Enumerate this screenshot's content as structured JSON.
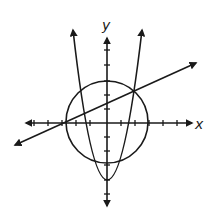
{
  "diagram": {
    "type": "coordinate-plane-graph",
    "axes": {
      "x_label": "x",
      "y_label": "y",
      "x_ticks": [
        -5,
        -4,
        -3,
        -2,
        -1,
        1,
        2,
        3,
        4,
        5
      ],
      "y_ticks": [
        -5,
        -4,
        -3,
        -2,
        -1,
        1,
        2,
        3,
        4,
        5
      ]
    },
    "curves": [
      {
        "name": "circle",
        "description": "Circle centered at origin, radius 3",
        "center": [
          0,
          0
        ],
        "radius": 3
      },
      {
        "name": "parabola",
        "description": "Upward-opening parabola with vertex at (0, -4)",
        "vertex": [
          0,
          -4
        ]
      },
      {
        "name": "line",
        "description": "Line with positive slope passing through (-3, 0)",
        "x_intercept": -3
      }
    ],
    "colors": {
      "stroke": "#1a1a1a",
      "background": "#ffffff"
    }
  }
}
